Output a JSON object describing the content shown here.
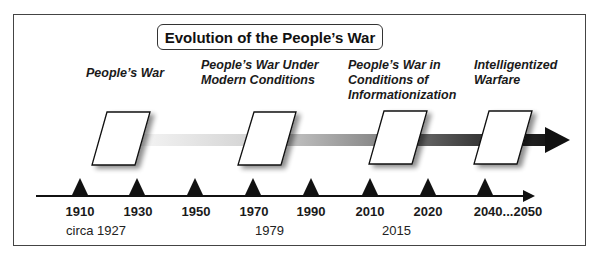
{
  "title": "Evolution of the People’s War",
  "eras": [
    {
      "lines": [
        "People’s War"
      ],
      "x": 86,
      "y": 66
    },
    {
      "lines": [
        "People’s War Under",
        "Modern Conditions"
      ],
      "x": 201,
      "y": 58
    },
    {
      "lines": [
        "People’s War in",
        "Conditions of",
        "Informationization"
      ],
      "x": 348,
      "y": 58
    },
    {
      "lines": [
        "Intelligentized",
        "Warfare"
      ],
      "x": 474,
      "y": 58
    }
  ],
  "era_text": {
    "e0l0": "People’s War",
    "e1l0": "People’s War Under",
    "e1l1": "Modern Conditions",
    "e2l0": "People’s War in",
    "e2l1": "Conditions of",
    "e2l2": "Informationization",
    "e3l0": "Intelligentized",
    "e3l1": "Warfare"
  },
  "timeline": {
    "years": [
      "1910",
      "1930",
      "1950",
      "1970",
      "1990",
      "2010",
      "2020",
      "2040...2050"
    ],
    "milestones": [
      "circa 1927",
      "1979",
      "2015"
    ]
  },
  "colors": {
    "frame": "#444444",
    "arrow_start": "#f2f2f2",
    "arrow_mid": "#9a9a9a",
    "arrow_end": "#111111",
    "marker": "#111111"
  }
}
